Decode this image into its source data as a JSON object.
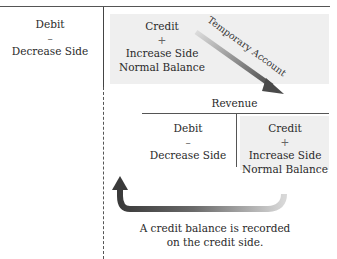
{
  "diagram": {
    "title_fragment": "T-Account Comparison (top cut off)",
    "left_column": {
      "side": "Debit",
      "sign": "–",
      "description": "Decrease Side"
    },
    "top_right": {
      "side": "Credit",
      "sign": "+",
      "line1": "Increase Side",
      "line2": "Normal Balance"
    },
    "diagonal_arrow_label": "Temporary Account",
    "revenue_account": {
      "title": "Revenue",
      "debit": {
        "side": "Debit",
        "sign": "–",
        "description": "Decrease Side"
      },
      "credit": {
        "side": "Credit",
        "sign": "+",
        "line1": "Increase Side",
        "line2": "Normal Balance"
      }
    },
    "caption": {
      "line1": "A credit balance is recorded",
      "line2": "on the credit side."
    },
    "colors": {
      "shade": "#efefef",
      "arrow_dark": "#3a3a3a",
      "arrow_light": "#d0d0d0",
      "rule": "#555555"
    }
  }
}
